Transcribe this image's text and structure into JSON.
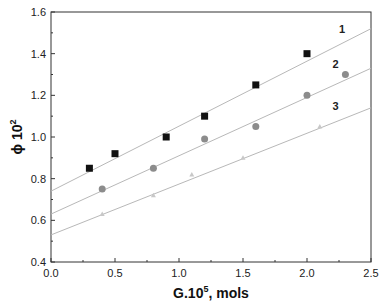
{
  "chart_data": {
    "type": "scatter",
    "title": "",
    "xlabel": "G.10^5, mols",
    "xlabel_main": "G.10",
    "xlabel_sup": "5",
    "xlabel_tail": ", mols",
    "ylabel": "ϕ 10^2",
    "ylabel_main": "ϕ 10",
    "ylabel_sup": "2",
    "xlim": [
      0.0,
      2.5
    ],
    "ylim": [
      0.4,
      1.6
    ],
    "xticks": [
      "0.0",
      "0.5",
      "1.0",
      "1.5",
      "2.0",
      "2.5"
    ],
    "yticks": [
      "0.4",
      "0.6",
      "0.8",
      "1.0",
      "1.2",
      "1.4",
      "1.6"
    ],
    "grid": false,
    "legend": "inline numeric labels",
    "series": [
      {
        "name": "1",
        "marker": "square",
        "color": "#111111",
        "x": [
          0.3,
          0.5,
          0.9,
          1.2,
          1.6,
          2.0
        ],
        "y": [
          0.85,
          0.92,
          1.0,
          1.1,
          1.25,
          1.4
        ],
        "fit_line": {
          "x": [
            0.0,
            2.5
          ],
          "y": [
            0.74,
            1.52
          ]
        },
        "label_pos": {
          "x": 2.25,
          "y": 1.5
        }
      },
      {
        "name": "2",
        "marker": "circle",
        "color": "#8c8c8c",
        "x": [
          0.4,
          0.8,
          1.2,
          1.6,
          2.0,
          2.3
        ],
        "y": [
          0.75,
          0.85,
          0.99,
          1.05,
          1.2,
          1.3
        ],
        "fit_line": {
          "x": [
            0.0,
            2.5
          ],
          "y": [
            0.63,
            1.33
          ]
        },
        "label_pos": {
          "x": 2.2,
          "y": 1.33
        }
      },
      {
        "name": "3",
        "marker": "triangle",
        "color": "#c8c8c8",
        "x": [
          0.4,
          0.8,
          1.1,
          1.5,
          2.1
        ],
        "y": [
          0.63,
          0.72,
          0.82,
          0.9,
          1.05
        ],
        "fit_line": {
          "x": [
            0.0,
            2.5
          ],
          "y": [
            0.53,
            1.14
          ]
        },
        "label_pos": {
          "x": 2.2,
          "y": 1.13
        }
      }
    ]
  }
}
